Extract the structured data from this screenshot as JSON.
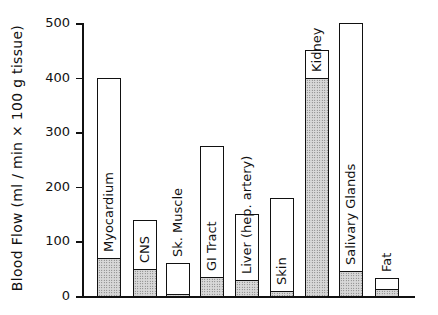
{
  "chart_data": {
    "type": "bar",
    "stacked": true,
    "title": "",
    "xlabel": "",
    "ylabel": "Blood Flow (ml / min × 100 g tissue)",
    "ylim": [
      0,
      500
    ],
    "yticks": [
      0,
      100,
      200,
      300,
      400,
      500
    ],
    "categories": [
      "Myocardium",
      "CNS",
      "Sk. Muscle",
      "GI Tract",
      "Liver (hep. artery)",
      "Skin",
      "Kidney",
      "Salivary Glands",
      "Fat"
    ],
    "series": [
      {
        "name": "Total (open bar)",
        "values": [
          400,
          140,
          60,
          275,
          150,
          180,
          450,
          500,
          33
        ]
      },
      {
        "name": "Stippled portion",
        "values": [
          70,
          50,
          3,
          35,
          30,
          10,
          400,
          45,
          12
        ]
      }
    ],
    "grid": false,
    "legend": "none"
  }
}
